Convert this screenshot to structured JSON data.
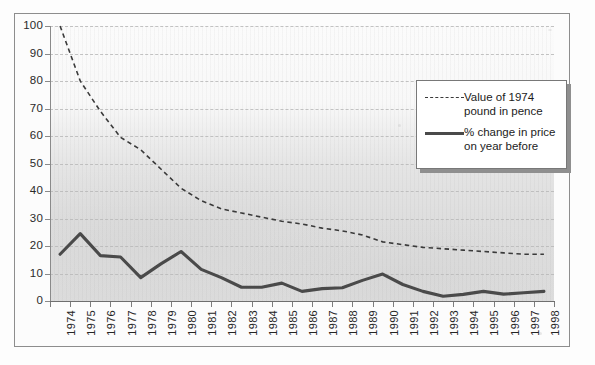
{
  "chart_data": {
    "type": "line",
    "title": "",
    "subtitle": "",
    "xlabel": "",
    "ylabel": "",
    "ylim": [
      0,
      100
    ],
    "ytick_interval": 10,
    "yticks": [
      "0",
      "10",
      "20",
      "30",
      "40",
      "50",
      "60",
      "70",
      "80",
      "90",
      "100"
    ],
    "grid": "horizontal dashed gridlines",
    "legend_position": "inside upper right",
    "categories": [
      "1974",
      "1975",
      "1976",
      "1977",
      "1978",
      "1979",
      "1980",
      "1981",
      "1982",
      "1983",
      "1984",
      "1985",
      "1986",
      "1987",
      "1988",
      "1989",
      "1990",
      "1991",
      "1992",
      "1993",
      "1994",
      "1995",
      "1996",
      "1997",
      "1998"
    ],
    "series": [
      {
        "name": "Value of 1974 pound in pence",
        "style": "dashed",
        "color": "#3a3a3a",
        "values": [
          100,
          80,
          69,
          59.5,
          55,
          48,
          41,
          36.5,
          33.5,
          32,
          30.5,
          29,
          28,
          26.5,
          25.5,
          24,
          21.5,
          20.5,
          19.5,
          19,
          18.5,
          18,
          17.5,
          17,
          17
        ]
      },
      {
        "name": "% change in price on year before",
        "style": "solid",
        "color": "#4a4a4a",
        "values": [
          17,
          24.5,
          16.5,
          16,
          8.5,
          13.5,
          18,
          11.5,
          8.5,
          5,
          5,
          6.5,
          3.5,
          4.5,
          4.8,
          7.5,
          9.8,
          6,
          3.5,
          1.7,
          2.4,
          3.5,
          2.5,
          3,
          3.5
        ]
      }
    ]
  },
  "legend": {
    "entries": [
      {
        "label": "Value of 1974\npound in pence",
        "style": "dashed"
      },
      {
        "label": "% change in price\non year before",
        "style": "solid"
      }
    ]
  },
  "colors": {
    "dashed_series": "#3a3a3a",
    "solid_series": "#4a4a4a",
    "gridline": "#b9b9b9",
    "axis": "#8a8a8a",
    "plot_background_top": "#fbfbfb",
    "plot_background_bottom": "#dcdcdc",
    "frame_border": "#8d8d8d",
    "legend_border": "#787878",
    "legend_background": "#ffffff",
    "text": "#252525"
  }
}
